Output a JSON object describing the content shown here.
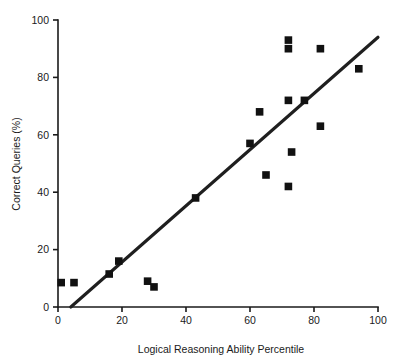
{
  "chart_data": {
    "type": "scatter",
    "title": "",
    "xlabel": "Logical Reasoning Ability Percentile",
    "ylabel": "Correct Queries (%)",
    "xlim": [
      0,
      100
    ],
    "ylim": [
      0,
      100
    ],
    "xticks": [
      0,
      20,
      40,
      60,
      80,
      100
    ],
    "yticks": [
      0,
      20,
      40,
      60,
      80,
      100
    ],
    "xtick_labels": [
      "0",
      "20",
      "40",
      "60",
      "80",
      "100"
    ],
    "ytick_labels": [
      "0",
      "20",
      "40",
      "60",
      "80",
      "100"
    ],
    "grid": false,
    "legend": false,
    "marker_shape": "square",
    "marker_color": "#111111",
    "points": [
      {
        "x": 1,
        "y": 8.5
      },
      {
        "x": 5,
        "y": 8.5
      },
      {
        "x": 16,
        "y": 11.5
      },
      {
        "x": 19,
        "y": 16
      },
      {
        "x": 28,
        "y": 9
      },
      {
        "x": 30,
        "y": 7
      },
      {
        "x": 43,
        "y": 38
      },
      {
        "x": 60,
        "y": 57
      },
      {
        "x": 63,
        "y": 68
      },
      {
        "x": 65,
        "y": 46
      },
      {
        "x": 72,
        "y": 93
      },
      {
        "x": 72,
        "y": 90
      },
      {
        "x": 72,
        "y": 72
      },
      {
        "x": 72,
        "y": 42
      },
      {
        "x": 73,
        "y": 54
      },
      {
        "x": 77,
        "y": 72
      },
      {
        "x": 82,
        "y": 90
      },
      {
        "x": 82,
        "y": 63
      },
      {
        "x": 94,
        "y": 83
      }
    ],
    "trendline": {
      "type": "linear",
      "color": "#1f1f1f",
      "x_start": 4,
      "y_start": 0,
      "x_end": 100,
      "y_end": 94
    }
  }
}
